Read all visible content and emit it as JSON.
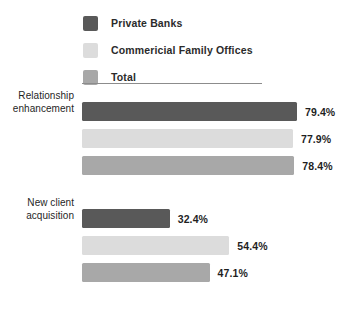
{
  "chart_data": {
    "type": "bar",
    "orientation": "horizontal",
    "title": "",
    "xlabel": "",
    "ylabel": "",
    "grid": false,
    "legend_position": "top-left",
    "value_suffix": "%",
    "xlim": [
      0,
      100
    ],
    "categories": [
      "Relationship enhancement",
      "New client acquisition"
    ],
    "series": [
      {
        "name": "Private Banks",
        "color": "#595959",
        "values": [
          79.4,
          32.4
        ],
        "labels": [
          "79.4%",
          "32.4%"
        ]
      },
      {
        "name": "Commericial Family Offices",
        "color": "#dcdcdc",
        "values": [
          77.9,
          54.4
        ],
        "labels": [
          "77.9%",
          "54.4%"
        ]
      },
      {
        "name": "Total",
        "color": "#a8a8a8",
        "values": [
          78.4,
          47.1
        ],
        "labels": [
          "78.4%",
          "47.1%"
        ]
      }
    ]
  },
  "legend": {
    "items": [
      {
        "label": "Private Banks",
        "color": "#595959"
      },
      {
        "label": "Commericial Family Offices",
        "color": "#dcdcdc"
      },
      {
        "label": "Total",
        "color": "#a8a8a8"
      }
    ]
  },
  "groups": [
    {
      "label_line1": "Relationship",
      "label_line2": "enhancement",
      "bars": [
        {
          "series": "Private Banks",
          "value": 79.4,
          "label": "79.4%",
          "color": "#595959"
        },
        {
          "series": "Commericial Family Offices",
          "value": 77.9,
          "label": "77.9%",
          "color": "#dcdcdc"
        },
        {
          "series": "Total",
          "value": 78.4,
          "label": "78.4%",
          "color": "#a8a8a8"
        }
      ]
    },
    {
      "label_line1": "New client",
      "label_line2": "acquisition",
      "bars": [
        {
          "series": "Private Banks",
          "value": 32.4,
          "label": "32.4%",
          "color": "#595959"
        },
        {
          "series": "Commericial Family Offices",
          "value": 54.4,
          "label": "54.4%",
          "color": "#dcdcdc"
        },
        {
          "series": "Total",
          "value": 47.1,
          "label": "47.1%",
          "color": "#a8a8a8"
        }
      ]
    }
  ],
  "scale": {
    "px_per_unit": 2.708
  }
}
